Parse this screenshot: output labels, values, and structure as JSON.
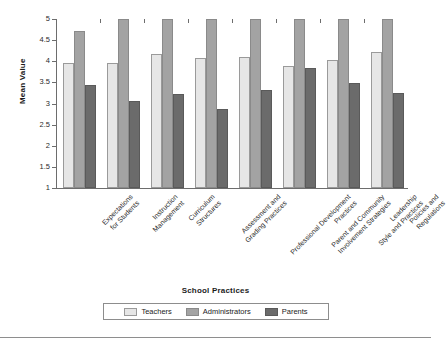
{
  "chart_data": {
    "type": "bar",
    "title": "",
    "xlabel": "School Practices",
    "ylabel": "Mean Value",
    "ylim": [
      1,
      5
    ],
    "yticks": [
      "5",
      "4.5",
      "4",
      "3.5",
      "3",
      "2.5",
      "2",
      "1.5",
      "1"
    ],
    "grid": false,
    "legend_position": "bottom",
    "categories": [
      "Expectations for Students",
      "Instruction Management",
      "Curriculum Structures",
      "Assessment and Grading Practices",
      "Professional Development Practices",
      "Parent and Community Involvement Strategies",
      "Leadership Style and Practices",
      "Policies and Regulations"
    ],
    "category_lines": [
      [
        "Expectations",
        "for Students"
      ],
      [
        "Instruction",
        "Management"
      ],
      [
        "Curriculum",
        "Structures"
      ],
      [
        "Assessment and",
        "Grading Practices"
      ],
      [
        "Professional Development",
        "Practices"
      ],
      [
        "Parent and Community",
        "Involvement Strategies"
      ],
      [
        "Leadership",
        "Style and Practices"
      ],
      [
        "Policies and",
        "Regulations"
      ]
    ],
    "series": [
      {
        "name": "Teachers",
        "color": "#e6e6e6",
        "values": [
          3.95,
          3.95,
          4.18,
          4.08,
          4.11,
          3.88,
          4.03,
          4.22
        ]
      },
      {
        "name": "Administrators",
        "color": "#a3a3a3",
        "values": [
          4.72,
          5.0,
          5.0,
          5.0,
          5.0,
          5.0,
          5.0,
          5.0
        ]
      },
      {
        "name": "Parents",
        "color": "#6b6b6b",
        "values": [
          3.44,
          3.05,
          3.23,
          2.87,
          3.31,
          3.83,
          3.48,
          3.26
        ]
      }
    ]
  }
}
